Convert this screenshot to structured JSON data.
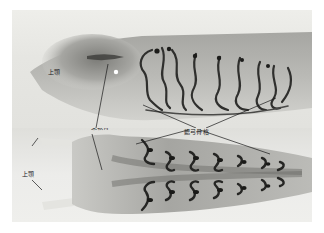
{
  "figure": {
    "panels": [
      {
        "id": "lateral",
        "view": "lateral view (top panel)"
      },
      {
        "id": "ventral",
        "view": "ventral view (bottom panel)"
      }
    ],
    "labels": {
      "upper_jaw_top": "上顎",
      "trabecular_cartilage": "梁軟骨",
      "branchial_arch_skeleton": "鰓弓骨格",
      "upper_jaw_bottom": "上顎"
    },
    "colors": {
      "background": "#ffffff",
      "tissue": "#8a8a86",
      "cartilage": "#2a2a28",
      "leader_line": "#1a1a1a"
    }
  }
}
